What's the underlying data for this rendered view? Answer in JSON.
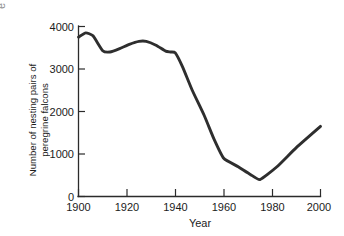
{
  "figure": {
    "background_color": "#ffffff",
    "line_color": "#2e2e2e",
    "axis_color": "#2b2b2b",
    "edge_fragment_text": "e"
  },
  "chart_data": {
    "type": "line",
    "title": "",
    "xlabel": "Year",
    "ylabel": "Number of nesting pairs of peregrine falcons",
    "ylabel_line1": "Number of nesting pairs of",
    "ylabel_line2": "peregrine falcons",
    "xlim": [
      1900,
      2000
    ],
    "ylim": [
      0,
      4000
    ],
    "xticks": [
      1900,
      1920,
      1940,
      1960,
      1980,
      2000
    ],
    "xtick_labels": [
      "1900",
      "1920",
      "1940",
      "1960",
      "1980",
      "2000"
    ],
    "yticks": [
      0,
      1000,
      2000,
      3000,
      4000
    ],
    "ytick_labels": [
      "0",
      "1000",
      "2000",
      "3000",
      "4000"
    ],
    "grid": false,
    "legend": false,
    "x": [
      1900,
      1903,
      1906,
      1910,
      1913,
      1917,
      1921,
      1925,
      1928,
      1932,
      1936,
      1938,
      1940,
      1943,
      1947,
      1952,
      1956,
      1960,
      1966,
      1971,
      1975,
      1982,
      1990,
      2000
    ],
    "values": [
      3750,
      3850,
      3780,
      3430,
      3400,
      3480,
      3580,
      3650,
      3650,
      3560,
      3420,
      3400,
      3380,
      3050,
      2500,
      1900,
      1350,
      900,
      700,
      520,
      400,
      700,
      1150,
      1650
    ],
    "series": [
      {
        "name": "Nesting pairs of peregrine falcons",
        "values": [
          3750,
          3850,
          3780,
          3430,
          3400,
          3480,
          3580,
          3650,
          3650,
          3560,
          3420,
          3400,
          3380,
          3050,
          2500,
          1900,
          1350,
          900,
          700,
          520,
          400,
          700,
          1150,
          1650
        ]
      }
    ],
    "annotations": []
  }
}
